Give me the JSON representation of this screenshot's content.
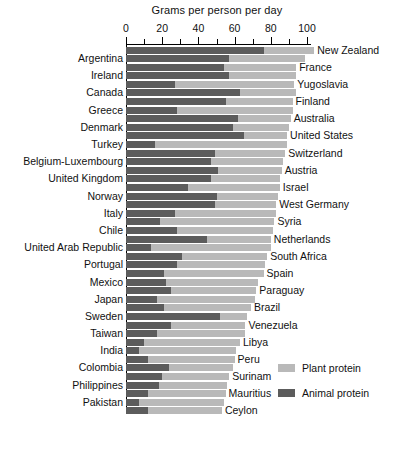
{
  "chart_data": {
    "type": "bar",
    "orientation": "horizontal",
    "stacked": true,
    "title": "Grams per person per day",
    "xlabel": "Grams per person per day",
    "ylabel": "",
    "xlim": [
      0,
      100
    ],
    "xticks": [
      0,
      20,
      40,
      60,
      80,
      100
    ],
    "xtick_labels": [
      "0",
      "20",
      "40",
      "60",
      "80",
      "100"
    ],
    "minor_tick_step": 10,
    "grid": false,
    "legend_position": "right-bottom",
    "series": [
      {
        "name": "Animal protein",
        "color": "#5c5c5c",
        "values": [
          76,
          57,
          54,
          57,
          27,
          63,
          55,
          28,
          62,
          59,
          65,
          16,
          49,
          47,
          51,
          47,
          34,
          50,
          49,
          27,
          19,
          28,
          45,
          14,
          31,
          28,
          21,
          22,
          25,
          17,
          21,
          52,
          25,
          17,
          10,
          7,
          12,
          24,
          20,
          18,
          12,
          7,
          12
        ]
      },
      {
        "name": "Plant protein",
        "color": "#b9b9b9",
        "values": [
          28,
          42,
          40,
          37,
          66,
          31,
          37,
          64,
          29,
          31,
          24,
          73,
          39,
          40,
          35,
          38,
          51,
          34,
          34,
          56,
          63,
          53,
          35,
          66,
          47,
          49,
          55,
          51,
          47,
          54,
          48,
          15,
          41,
          49,
          53,
          54,
          48,
          35,
          37,
          38,
          43,
          47,
          41
        ]
      }
    ],
    "categories": [
      "New Zealand",
      "Argentina",
      "France",
      "Ireland",
      "Yugoslavia",
      "Canada",
      "Finland",
      "Greece",
      "Australia",
      "Denmark",
      "United States",
      "Turkey",
      "Switzerland",
      "Belgium-Luxembourg",
      "Austria",
      "United Kingdom",
      "Israel",
      "Norway",
      "West Germany",
      "Italy",
      "Syria",
      "Chile",
      "Netherlands",
      "United Arab Republic",
      "South Africa",
      "Portugal",
      "Spain",
      "Mexico",
      "Paraguay",
      "Japan",
      "Brazil",
      "Sweden",
      "Venezuela",
      "Taiwan",
      "Libya",
      "India",
      "Peru",
      "Colombia",
      "Surinam",
      "Philippines",
      "Mauritius",
      "Pakistan",
      "Ceylon"
    ],
    "label_sides": [
      "right",
      "left",
      "right",
      "left",
      "right",
      "left",
      "right",
      "left",
      "right",
      "left",
      "right",
      "left",
      "right",
      "left",
      "right",
      "left",
      "right",
      "left",
      "right",
      "left",
      "right",
      "left",
      "right",
      "left",
      "right",
      "left",
      "right",
      "left",
      "right",
      "left",
      "right",
      "left",
      "right",
      "left",
      "right",
      "left",
      "right",
      "left",
      "right",
      "left",
      "right",
      "left",
      "right"
    ],
    "totals": [
      104,
      99,
      94,
      94,
      93,
      94,
      92,
      92,
      91,
      90,
      89,
      89,
      88,
      87,
      86,
      85,
      85,
      84,
      83,
      83,
      82,
      81,
      80,
      80,
      78,
      77,
      76,
      73,
      72,
      71,
      69,
      67,
      66,
      66,
      63,
      61,
      60,
      59,
      57,
      56,
      55,
      54,
      53
    ]
  },
  "legend": {
    "items": [
      {
        "label": "Plant protein",
        "color": "#b9b9b9"
      },
      {
        "label": "Animal protein",
        "color": "#5c5c5c"
      }
    ]
  }
}
